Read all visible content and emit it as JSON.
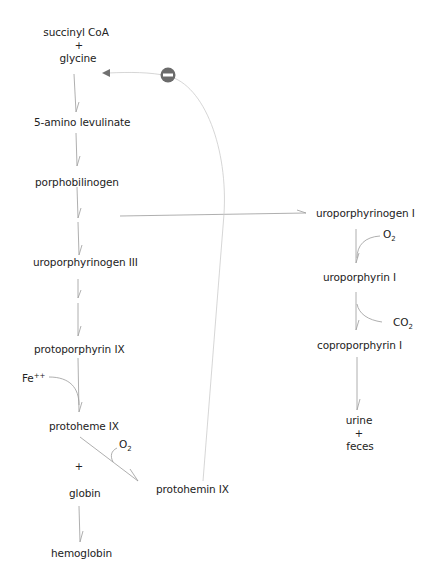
{
  "diagram": {
    "main_pathway": {
      "succinyl_coa": "succinyl CoA",
      "plus1": "+",
      "glycine": "glycine",
      "ala": "5-amino levulinate",
      "pbg": "porphobilinogen",
      "uro3": "uroporphyrinogen III",
      "proto": "protoporphyrin IX",
      "fe": "Fe",
      "fe_charge": "++",
      "protoheme": "protoheme IX",
      "o2_left": "O",
      "o2_left_sub": "2",
      "plus2": "+",
      "globin": "globin",
      "hemoglobin": "hemoglobin",
      "protohemin": "protohemin IX"
    },
    "side_pathway": {
      "uro1gen": "uroporphyrinogen I",
      "o2": "O",
      "o2_sub": "2",
      "uro1": "uroporphyrin I",
      "co2": "CO",
      "co2_sub": "2",
      "copro1": "coproporphyrin I",
      "urine": "urine",
      "plus": "+",
      "feces": "feces"
    },
    "feedback": {
      "inhibition_symbol": "minus-circle",
      "from": "protohemin IX",
      "to": "succinyl CoA + glycine"
    },
    "colors": {
      "text": "#222222",
      "arrow": "#9a9a9a",
      "feedback_line": "#c8c8c8",
      "inhibitor_fill": "#6b6b6b"
    }
  }
}
